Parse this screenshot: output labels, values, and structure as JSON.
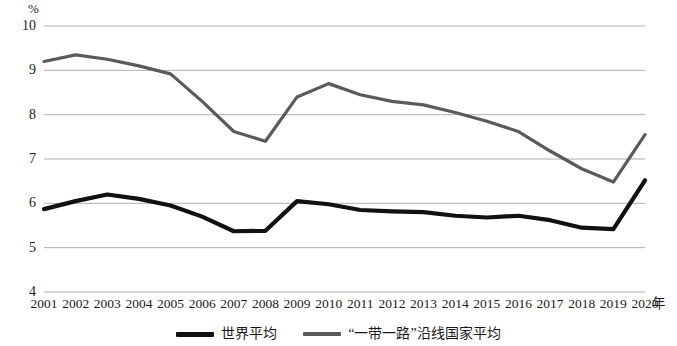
{
  "chart_data": {
    "type": "line",
    "title": "",
    "subtitle": "",
    "xlabel": "年",
    "ylabel": "%",
    "x": [
      2001,
      2002,
      2003,
      2004,
      2005,
      2006,
      2007,
      2008,
      2009,
      2010,
      2011,
      2012,
      2013,
      2014,
      2015,
      2016,
      2017,
      2018,
      2019,
      2020
    ],
    "categories": [
      "2001",
      "2002",
      "2003",
      "2004",
      "2005",
      "2006",
      "2007",
      "2008",
      "2009",
      "2010",
      "2011",
      "2012",
      "2013",
      "2014",
      "2015",
      "2016",
      "2017",
      "2018",
      "2019",
      "2020"
    ],
    "xlim": [
      2001,
      2020
    ],
    "ylim": [
      4,
      10
    ],
    "yticks": [
      10,
      9,
      8,
      7,
      6,
      5,
      4
    ],
    "ytick_labels": [
      "10",
      "9",
      "8",
      "7",
      "6",
      "5",
      "4"
    ],
    "grid": true,
    "grid_axis": "y",
    "legend_position": "bottom-center",
    "series": [
      {
        "name": "世界平均",
        "color": "#111111",
        "width": 4.2,
        "values": [
          5.87,
          6.05,
          6.2,
          6.1,
          5.95,
          5.7,
          5.37,
          5.38,
          6.05,
          5.98,
          5.85,
          5.82,
          5.8,
          5.72,
          5.68,
          5.72,
          5.62,
          5.45,
          5.42,
          6.52
        ]
      },
      {
        "name": "“一带一路”沿线国家平均",
        "color": "#5a5a5a",
        "width": 3.2,
        "values": [
          9.2,
          9.35,
          9.25,
          9.1,
          8.92,
          8.3,
          7.62,
          7.4,
          8.4,
          8.7,
          8.45,
          8.3,
          8.22,
          8.05,
          7.85,
          7.62,
          7.18,
          6.78,
          6.48,
          7.55
        ]
      }
    ]
  },
  "legend": {
    "items": [
      {
        "label": "世界平均",
        "color": "#111111"
      },
      {
        "label": "“一带一路”沿线国家平均",
        "color": "#5a5a5a"
      }
    ]
  }
}
